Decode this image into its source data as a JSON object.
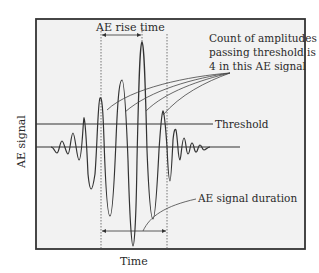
{
  "figure": {
    "y_axis_label": "AE signal",
    "x_axis_label": "Time",
    "annotations": {
      "rise_time": "AE rise time",
      "count_line1": "Count of amplitudes",
      "count_line2": "passing threshold is",
      "count_line3": "4 in this AE signal",
      "threshold": "Threshold",
      "duration": "AE signal duration"
    },
    "colors": {
      "background": "#f2f2f2",
      "frame": "#333333",
      "line": "#3a3a3a"
    }
  }
}
